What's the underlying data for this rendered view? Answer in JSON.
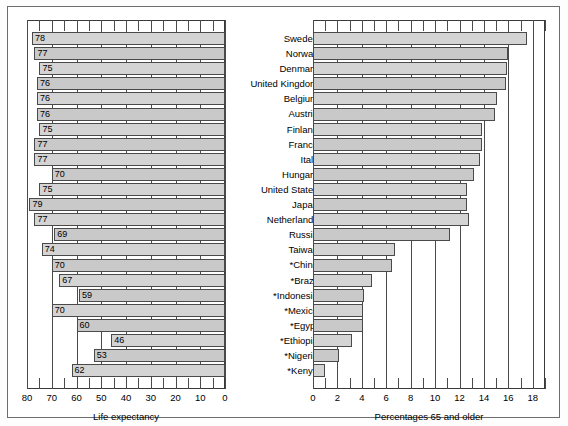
{
  "figure": {
    "left_panel": {
      "axis_title": "Life expectancy",
      "x_ticks": [
        "80",
        "70",
        "60",
        "50",
        "40",
        "30",
        "20",
        "10",
        "0"
      ],
      "x_min": 0,
      "x_max": 80,
      "reversed": true
    },
    "right_panel": {
      "axis_title": "Percentages 65 and older",
      "x_ticks": [
        "0",
        "2",
        "4",
        "6",
        "8",
        "10",
        "12",
        "14",
        "16",
        "18"
      ],
      "x_min": 0,
      "x_max": 19,
      "reversed": false
    },
    "footnote_marker": "*"
  },
  "chart_data": {
    "type": "bar",
    "title": "",
    "orientation": "horizontal",
    "grid": true,
    "legend": "none",
    "categories": [
      "Sweden",
      "Norway",
      "Denmark",
      "United Kingdom",
      "Belgium",
      "Austria",
      "Finland",
      "France",
      "Italy",
      "Hungary",
      "United States",
      "Japan",
      "Netherlands",
      "Russia",
      "Taiwan",
      "*China",
      "*Brazil",
      "*Indonesia",
      "*Mexico",
      "*Egypt",
      "*Ethiopia",
      "*Nigeria",
      "*Kenya"
    ],
    "series": [
      {
        "name": "Life expectancy",
        "xlabel": "Life expectancy",
        "xlim": [
          80,
          0
        ],
        "axis_direction": "right-to-left",
        "values": [
          78,
          77,
          75,
          76,
          76,
          76,
          75,
          77,
          77,
          70,
          75,
          79,
          77,
          69,
          74,
          70,
          67,
          59,
          70,
          60,
          46,
          53,
          62
        ],
        "labels": [
          "78",
          "77",
          "75",
          "76",
          "76",
          "76",
          "75",
          "77",
          "77",
          "70",
          "75",
          "79",
          "77",
          "69",
          "74",
          "70",
          "67",
          "59",
          "70",
          "60",
          "46",
          "53",
          "62"
        ]
      },
      {
        "name": "Percentages 65 and older",
        "xlabel": "Percentages 65 and older",
        "xlim": [
          0,
          19
        ],
        "axis_direction": "left-to-right",
        "values": [
          17.5,
          16.0,
          15.9,
          15.8,
          15.1,
          14.9,
          13.8,
          13.8,
          13.7,
          13.2,
          12.6,
          12.6,
          12.8,
          11.2,
          6.7,
          6.5,
          4.8,
          4.2,
          4.1,
          4.1,
          3.2,
          2.1,
          1.0
        ],
        "labels": []
      }
    ]
  }
}
